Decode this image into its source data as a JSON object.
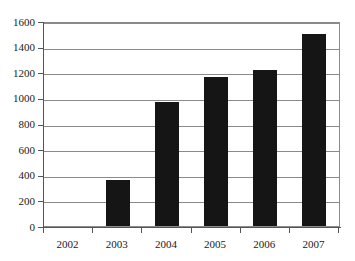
{
  "chart_data": {
    "type": "bar",
    "title": "",
    "subtitle": "",
    "xlabel": "",
    "ylabel": "",
    "categories": [
      "2002",
      "2003",
      "2004",
      "2005",
      "2006",
      "2007"
    ],
    "values": [
      0,
      360,
      970,
      1160,
      1220,
      1500
    ],
    "series": [
      {
        "name": "",
        "values": [
          0,
          360,
          970,
          1160,
          1220,
          1500
        ]
      }
    ],
    "ylim": [
      0,
      1600
    ],
    "y_ticks": [
      0,
      200,
      400,
      600,
      800,
      1000,
      1200,
      1400,
      1600
    ],
    "y_tick_labels": [
      "0",
      "200",
      "400",
      "600",
      "800",
      "1000",
      "1200",
      "1400",
      "1600"
    ],
    "x_tick_labels": [
      "2002",
      "2003",
      "2004",
      "2005",
      "2006",
      "2007"
    ],
    "grid": true,
    "grid_axis": "y",
    "legend": false,
    "legend_position": "none",
    "annotations": [],
    "colors": {
      "bar": "#151515",
      "grid": "#8a8a8a",
      "frame": "#8a8a8a",
      "axis": "#555555",
      "background": "#ffffff",
      "text": "#1a1a1a"
    }
  }
}
